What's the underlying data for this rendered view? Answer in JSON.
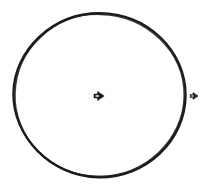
{
  "figure": {
    "title": "Hand-drawn circle with two arrow cursor markers",
    "background_color": "#ffffff",
    "width": 210,
    "height": 189
  },
  "shapes": {
    "circle": {
      "label": "hand-drawn circle outline",
      "center_x": 99,
      "center_y": 95,
      "radius_x": 86,
      "radius_y": 82,
      "stroke_color": "#1c1c1c",
      "stroke_width": 2.2,
      "fill": "none",
      "style": "sketched"
    }
  },
  "markers": [
    {
      "name": "center-arrow-marker",
      "label": "right-pointing arrow at circle center",
      "x": 99,
      "y": 96,
      "size": 11,
      "direction": "right",
      "fill_color": "#1c1c1c",
      "inner_color": "#ffffff"
    },
    {
      "name": "right-arrow-marker",
      "label": "right-pointing arrow outside right edge",
      "x": 194,
      "y": 96,
      "size": 8,
      "direction": "right",
      "fill_color": "#1c1c1c",
      "inner_color": "#ffffff"
    }
  ],
  "chart_data": {
    "type": "diagram",
    "title": "Hand-drawn circle with two arrow cursor markers",
    "elements": [
      {
        "kind": "circle",
        "cx": 99,
        "cy": 95,
        "rx": 86,
        "ry": 82,
        "stroke": "#1c1c1c",
        "fill": "none"
      },
      {
        "kind": "arrow",
        "x": 99,
        "y": 96,
        "points": "right",
        "size": 11
      },
      {
        "kind": "arrow",
        "x": 194,
        "y": 96,
        "points": "right",
        "size": 8
      }
    ],
    "xlabel": "",
    "ylabel": "",
    "legend": []
  }
}
